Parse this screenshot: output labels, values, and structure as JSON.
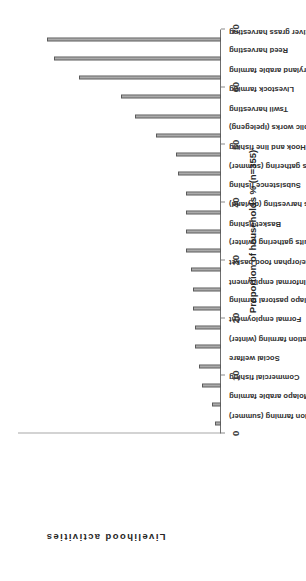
{
  "chart_data": {
    "type": "bar",
    "title": "",
    "subtitle": "",
    "orientation": "vertical-rotated",
    "xlabel": "Livelihood activities",
    "ylabel": "Proportion of households % (n=355)",
    "ylim": [
      0,
      70
    ],
    "ytick_values": [
      0,
      10,
      20,
      30,
      40,
      50,
      60,
      70
    ],
    "ytick_labels": [
      "0",
      "10",
      "20",
      "30",
      "40",
      "50",
      "60",
      "70"
    ],
    "grid": false,
    "legend": null,
    "legend_position": "none",
    "n": 355,
    "categories": [
      "Vegetable irrigation farming (summer)",
      "Molapo arable farming",
      "Commercial fishing",
      "Social welfare",
      "Vegetable irrigation farming (winter)",
      "Formal employment",
      "Molapo pastoral farming",
      "Informal employment",
      "Destitute/orphan food basket",
      "River wild fruits gathering (winter)",
      "Basket fishing",
      "Grass harvesting (dryland)",
      "Subsistence fishing",
      "River wild fruits gathering (summer)",
      "Hook and line fishing",
      "Labour-intensive public works (ipelegeng)",
      "Tswii harvesting",
      "Livestock farming",
      "Dryland arable farming",
      "Reed harvesting",
      "River grass harvesting"
    ],
    "values": [
      2,
      3,
      6.5,
      7.5,
      9,
      9,
      9.5,
      9.5,
      10.5,
      12,
      12,
      12,
      12,
      15,
      15.5,
      22.5,
      29.5,
      34.5,
      49,
      57.5,
      60
    ],
    "bar_color": "#8f8f8f",
    "bar_edge_color": "#5a5a5a",
    "axis_color": "#8a8a8a"
  },
  "axis_titles": {
    "value_axis": "Proportion of households % (n=355)",
    "category_axis": "Livelihood activities"
  }
}
